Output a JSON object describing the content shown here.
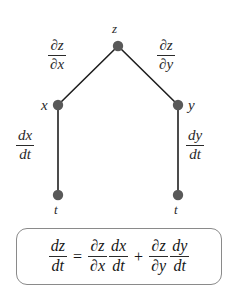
{
  "diagram": {
    "type": "chain-rule-tree",
    "nodes": [
      {
        "id": "z",
        "label": "z",
        "x": 118,
        "y": 46
      },
      {
        "id": "x",
        "label": "x",
        "x": 58,
        "y": 105
      },
      {
        "id": "y",
        "label": "y",
        "x": 178,
        "y": 105
      },
      {
        "id": "t-left",
        "label": "t",
        "x": 58,
        "y": 195
      },
      {
        "id": "t-right",
        "label": "t",
        "x": 178,
        "y": 195
      }
    ],
    "node_color": "#595959",
    "edge_color": "#1f1f1f",
    "node_radius": 5.2,
    "edges": [
      {
        "from": "z",
        "to": "x",
        "label_num": "∂z",
        "label_den": "∂x"
      },
      {
        "from": "z",
        "to": "y",
        "label_num": "∂z",
        "label_den": "∂y"
      },
      {
        "from": "x",
        "to": "t-left",
        "label_num": "dx",
        "label_den": "dt"
      },
      {
        "from": "y",
        "to": "t-right",
        "label_num": "dy",
        "label_den": "dt"
      }
    ],
    "edge_labels": {
      "dz_dx": {
        "num": "∂z",
        "den": "∂x"
      },
      "dz_dy": {
        "num": "∂z",
        "den": "∂y"
      },
      "dx_dt": {
        "num": "dx",
        "den": "dt"
      },
      "dy_dt": {
        "num": "dy",
        "den": "dt"
      }
    }
  },
  "formula": {
    "lhs": {
      "num": "dz",
      "den": "dt"
    },
    "equals": "=",
    "term1": {
      "partial": {
        "num": "∂z",
        "den": "∂x"
      },
      "ordinary": {
        "num": "dx",
        "den": "dt"
      }
    },
    "plus": "+",
    "term2": {
      "partial": {
        "num": "∂z",
        "den": "∂y"
      },
      "ordinary": {
        "num": "dy",
        "den": "dt"
      }
    },
    "border_color": "#8a8a8a"
  }
}
